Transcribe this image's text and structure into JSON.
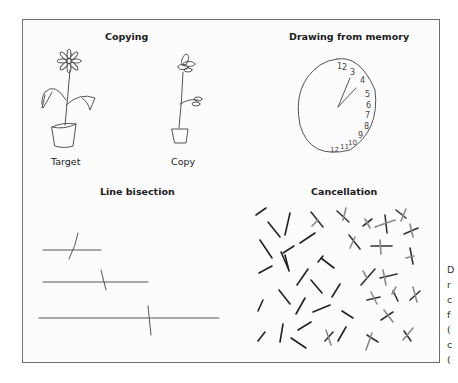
{
  "panels": {
    "copying": {
      "title": "Copying",
      "target_label": "Target",
      "copy_label": "Copy"
    },
    "memory": {
      "title": "Drawing from memory",
      "clock_numbers": [
        "1",
        "2",
        "3",
        "4",
        "5",
        "6",
        "7",
        "8",
        "9",
        "10",
        "11",
        "12"
      ]
    },
    "bisection": {
      "title": "Line bisection"
    },
    "cancellation": {
      "title": "Cancellation"
    }
  },
  "side_text": [
    "D",
    "r",
    "c",
    "f",
    "(",
    "c",
    "("
  ],
  "colors": {
    "stroke": "#555555",
    "dark_stroke": "#222222",
    "light_stroke": "#8a8a8a",
    "frame": "#6e6e6e"
  }
}
